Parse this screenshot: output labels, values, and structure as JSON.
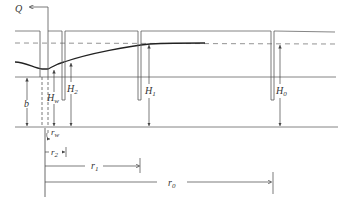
{
  "figure": {
    "type": "confined-aquifer-well-drawdown",
    "labels": {
      "discharge": "Q",
      "aquifer_thickness": "b",
      "well_head": "H",
      "well_head_sub": "w",
      "obs2_head": "H",
      "obs2_sub": "2",
      "obs1_head": "H",
      "obs1_sub": "1",
      "obs0_head": "H",
      "obs0_sub": "0",
      "r_well": "r",
      "r_well_sub": "w",
      "r2": "r",
      "r2_sub": "2",
      "r1": "r",
      "r1_sub": "1",
      "r0": "r",
      "r0_sub": "0"
    },
    "colors": {
      "line": "#555555",
      "curve": "#222222",
      "text": "#333333"
    }
  }
}
